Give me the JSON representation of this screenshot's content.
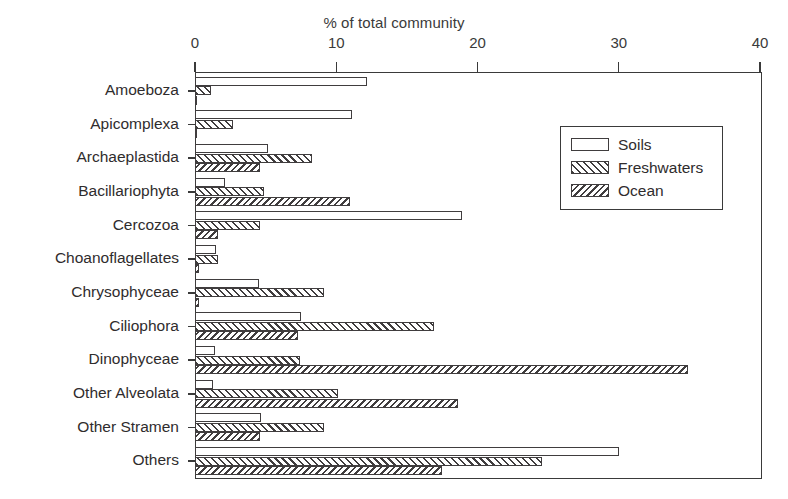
{
  "chart_data": {
    "type": "bar",
    "orientation": "horizontal",
    "title": "",
    "xlabel": "% of total community",
    "ylabel": "",
    "xlim": [
      0,
      40
    ],
    "xticks": [
      0,
      10,
      20,
      30,
      40
    ],
    "xticklabels": [
      "0",
      "10",
      "20",
      "30",
      "40"
    ],
    "grid": false,
    "legend_position": "upper right",
    "categories": [
      "Amoeboza",
      "Apicomplexa",
      "Archaeplastida",
      "Bacillariophyta",
      "Cercozoa",
      "Choanoflagellates",
      "Chrysophyceae",
      "Ciliophora",
      "Dinophyceae",
      "Other Alveolata",
      "Other Stramen",
      "Others"
    ],
    "series": [
      {
        "name": "Soils",
        "fill": "empty",
        "values": [
          12.2,
          11.1,
          5.2,
          2.1,
          18.9,
          1.5,
          4.5,
          7.5,
          1.4,
          1.3,
          4.7,
          30.0
        ]
      },
      {
        "name": "Freshwaters",
        "fill": "hatch-forward",
        "values": [
          1.1,
          2.7,
          8.3,
          4.9,
          4.6,
          1.6,
          9.1,
          16.9,
          7.4,
          10.1,
          9.1,
          24.6
        ]
      },
      {
        "name": "Ocean",
        "fill": "hatch-backward",
        "values": [
          0.15,
          0.15,
          4.6,
          11.0,
          1.6,
          0.25,
          0.3,
          7.3,
          34.9,
          18.6,
          4.6,
          17.5
        ]
      }
    ]
  },
  "axis": {
    "title": "% of total community"
  },
  "legend": {
    "entries": [
      {
        "label": "Soils"
      },
      {
        "label": "Freshwaters"
      },
      {
        "label": "Ocean"
      }
    ]
  },
  "colors": {
    "ink": "#403d3e",
    "text": "#2f2c2d",
    "background": "#ffffff"
  }
}
